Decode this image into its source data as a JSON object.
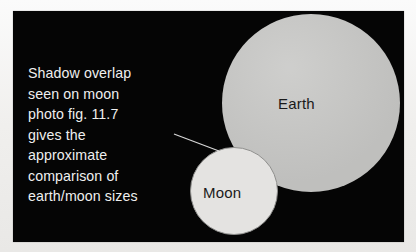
{
  "figure": {
    "background_color": "#050505",
    "page_color": "#f3f2f0",
    "caption_lines": [
      "Shadow overlap",
      "seen on moon",
      "photo fig. 11.7",
      "gives the",
      "approximate",
      "comparison of",
      "earth/moon sizes"
    ],
    "caption_text": "Shadow overlap seen on moon photo fig. 11.7 gives the approximate comparison of earth/moon sizes",
    "bodies": [
      {
        "name": "Earth",
        "label": "Earth",
        "fill_color": "#c9c9c7",
        "relative_size": "large"
      },
      {
        "name": "Moon",
        "label": "Moon",
        "fill_color": "#e4e3e1",
        "outline_color": "#8f8f8d",
        "relative_size": "small"
      }
    ],
    "leader_line": {
      "name": "caption-to-moon-pointer",
      "color": "#d8d8d8"
    }
  }
}
